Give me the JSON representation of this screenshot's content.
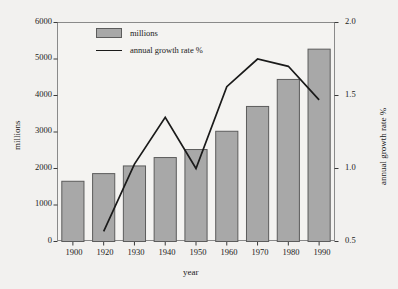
{
  "chart_data": {
    "type": "bar",
    "title": "",
    "subtitle": "",
    "xlabel": "year",
    "ylabel": "millions",
    "y2label": "annual growth rate %",
    "categories": [
      "1900",
      "1920",
      "1930",
      "1940",
      "1950",
      "1960",
      "1970",
      "1980",
      "1990"
    ],
    "x": [
      1900,
      1920,
      1930,
      1940,
      1950,
      1960,
      1970,
      1980,
      1990
    ],
    "ylim": [
      0,
      6000
    ],
    "y2lim": [
      0.5,
      2.0
    ],
    "yticks": [
      0,
      1000,
      2000,
      3000,
      4000,
      5000,
      6000
    ],
    "yticklabels": [
      "0",
      "1000",
      "2000",
      "3000",
      "4000",
      "5000",
      "6000"
    ],
    "y2ticks": [
      0.5,
      1.0,
      1.5,
      2.0
    ],
    "y2ticklabels": [
      "0.5",
      "1.0",
      "1.5",
      "2.0"
    ],
    "grid": false,
    "legend_position": "upper left",
    "series": [
      {
        "name": "millions",
        "type": "bar",
        "axis": "left",
        "color": "#a8a8a8",
        "edge_color": "#5c5c5c",
        "values": [
          1650,
          1860,
          2070,
          2300,
          2520,
          3020,
          3700,
          4440,
          5270
        ]
      },
      {
        "name": "annual growth rate %",
        "type": "line",
        "axis": "right",
        "color": "#1a1a1a",
        "values": [
          null,
          0.57,
          1.03,
          1.35,
          1.0,
          1.56,
          1.75,
          1.7,
          1.47
        ]
      }
    ]
  },
  "legend": {
    "items": [
      {
        "label": "millions",
        "marker": "bar-swatch"
      },
      {
        "label": "annual growth rate %",
        "marker": "line-swatch"
      }
    ]
  },
  "axes": {
    "x_title": "year",
    "y_left_title": "millions",
    "y_right_title": "annual growth rate %"
  }
}
